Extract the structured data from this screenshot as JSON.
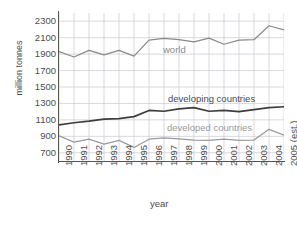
{
  "chart_data": {
    "type": "line",
    "title": "",
    "xlabel": "year",
    "ylabel": "million tonnes",
    "xlim": [
      1990,
      2005
    ],
    "ylim": [
      600,
      2400
    ],
    "yticks": [
      2300,
      2100,
      1900,
      1700,
      1500,
      1300,
      1100,
      900,
      700
    ],
    "grid": true,
    "legend_position": "inline-annotations",
    "categories": [
      "1990",
      "1991",
      "1992",
      "1993",
      "1994",
      "1995",
      "1996",
      "1997",
      "1998",
      "1999",
      "2000",
      "2001",
      "2002",
      "2003",
      "2004",
      "2005 (est.)"
    ],
    "series": [
      {
        "name": "world",
        "color": "#8a8a8a",
        "values": [
          1930,
          1865,
          1945,
          1890,
          1945,
          1875,
          2070,
          2090,
          2075,
          2050,
          2095,
          2020,
          2070,
          2075,
          2245,
          2195
        ]
      },
      {
        "name": "developing countries",
        "color": "#3d3d3d",
        "values": [
          1040,
          1065,
          1085,
          1110,
          1115,
          1140,
          1215,
          1205,
          1235,
          1250,
          1205,
          1215,
          1200,
          1225,
          1250,
          1260
        ]
      },
      {
        "name": "developed countries",
        "color": "#9a9a9a",
        "values": [
          905,
          830,
          865,
          805,
          850,
          765,
          865,
          880,
          870,
          855,
          850,
          865,
          850,
          855,
          985,
          915
        ]
      }
    ]
  },
  "axes": {
    "y_title": "million tonnes",
    "x_title": "year",
    "y_tick_labels": [
      "2300",
      "2100",
      "1900",
      "1700",
      "1500",
      "1300",
      "1100",
      "900",
      "700"
    ],
    "x_tick_labels": [
      "1990",
      "1991",
      "1992",
      "1993",
      "1994",
      "1995",
      "1996",
      "1997",
      "1998",
      "1999",
      "2000",
      "2001",
      "2002",
      "2003",
      "2004",
      "2005 (est.)"
    ]
  },
  "annotations": {
    "world": "world",
    "developing": "developing countries",
    "developed": "developed countries"
  },
  "colors": {
    "world_line": "#8a8a8a",
    "developing_line": "#3d3d3d",
    "developed_line": "#9a9a9a",
    "grid": "#c8c8d2",
    "axis": "#555555",
    "text": "#4d4d4d",
    "background": "#ffffff"
  }
}
